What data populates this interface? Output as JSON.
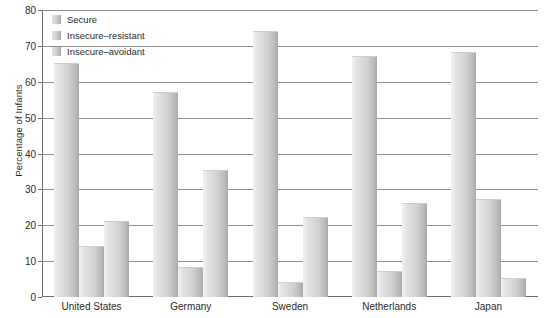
{
  "chart_data": {
    "type": "bar",
    "title": "",
    "xlabel": "",
    "ylabel": "Percentage of Infants",
    "ylim": [
      0,
      80
    ],
    "yticks": [
      0,
      10,
      20,
      30,
      40,
      50,
      60,
      70,
      80
    ],
    "grid": true,
    "legend_position": "top-left",
    "categories": [
      "United States",
      "Germany",
      "Sweden",
      "Netherlands",
      "Japan"
    ],
    "series": [
      {
        "name": "Secure",
        "values": [
          65,
          57,
          74,
          67,
          68
        ]
      },
      {
        "name": "Insecure-resistant",
        "values": [
          14,
          8,
          4,
          7,
          27
        ]
      },
      {
        "name": "Insecure-avoidant",
        "values": [
          21,
          35,
          22,
          26,
          5
        ]
      }
    ]
  },
  "legend": {
    "items": [
      {
        "label": "Secure"
      },
      {
        "label": "Insecure–resistant"
      },
      {
        "label": "Insecure–avoidant"
      }
    ]
  },
  "axes": {
    "y_title": "Percentage of Infants",
    "y_tick_labels": [
      "0",
      "10",
      "20",
      "30",
      "40",
      "50",
      "60",
      "70",
      "80"
    ],
    "x_tick_labels": [
      "United States",
      "Germany",
      "Sweden",
      "Netherlands",
      "Japan"
    ]
  },
  "colors": {
    "grid": "#8f8f8f",
    "axis": "#6e6e6e",
    "bar_light": "#f2f2f2",
    "bar_dark": "#a8a8a8",
    "text": "#2a2a2a"
  }
}
